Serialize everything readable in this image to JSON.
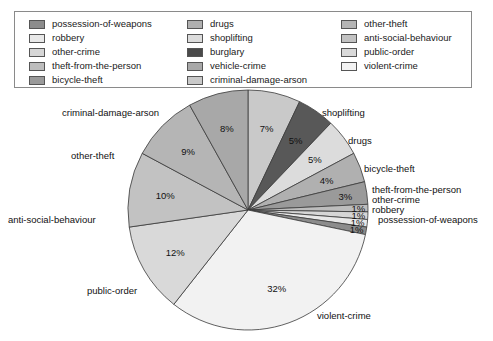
{
  "legend": {
    "columns": [
      [
        {
          "label": "possession-of-weapons",
          "color": "#8c8c8c"
        },
        {
          "label": "robbery",
          "color": "#e8e8e8"
        },
        {
          "label": "other-crime",
          "color": "#d6d6d6"
        },
        {
          "label": "theft-from-the-person",
          "color": "#bdbdbd"
        },
        {
          "label": "bicycle-theft",
          "color": "#9a9a9a"
        }
      ],
      [
        {
          "label": "drugs",
          "color": "#b0b0b0"
        },
        {
          "label": "shoplifting",
          "color": "#dcdcdc"
        },
        {
          "label": "burglary",
          "color": "#4a4a4a"
        },
        {
          "label": "vehicle-crime",
          "color": "#a8a8a8"
        },
        {
          "label": "criminal-damage-arson",
          "color": "#c9c9c9"
        }
      ],
      [
        {
          "label": "other-theft",
          "color": "#b5b5b5"
        },
        {
          "label": "anti-social-behaviour",
          "color": "#c2c2c2"
        },
        {
          "label": "public-order",
          "color": "#d9d9d9"
        },
        {
          "label": "violent-crime",
          "color": "#f2f2f2"
        }
      ]
    ]
  },
  "chart_data": {
    "type": "pie",
    "title": "",
    "unit": "%",
    "start_angle_deg": -90,
    "direction": "clockwise",
    "categories": [
      "criminal-damage-arson",
      "burglary",
      "shoplifting",
      "drugs",
      "bicycle-theft",
      "theft-from-the-person",
      "other-crime",
      "robbery",
      "possession-of-weapons",
      "violent-crime",
      "public-order",
      "anti-social-behaviour",
      "other-theft",
      "vehicle-crime"
    ],
    "values": [
      7,
      5,
      5,
      4,
      3,
      1,
      1,
      1,
      1,
      32,
      12,
      10,
      9,
      8
    ],
    "value_labels": [
      "7%",
      "5%",
      "5%",
      "4%",
      "3%",
      "1%",
      "1%",
      "1%",
      "1%",
      "32%",
      "12%",
      "10%",
      "9%",
      "8%"
    ],
    "colors": [
      "#c9c9c9",
      "#585858",
      "#dcdcdc",
      "#b0b0b0",
      "#9a9a9a",
      "#bdbdbd",
      "#d6d6d6",
      "#e8e8e8",
      "#8c8c8c",
      "#f2f2f2",
      "#d9d9d9",
      "#c2c2c2",
      "#b5b5b5",
      "#a8a8a8"
    ],
    "callouts": [
      {
        "label": "criminal-damage-arson",
        "x": 62,
        "y": 19
      },
      {
        "label": "other-theft",
        "x": 71,
        "y": 62
      },
      {
        "label": "anti-social-behaviour",
        "x": 8,
        "y": 126
      },
      {
        "label": "public-order",
        "x": 87,
        "y": 197
      },
      {
        "label": "violent-crime",
        "x": 317,
        "y": 222
      },
      {
        "label": "shoplifting",
        "x": 322,
        "y": 19
      },
      {
        "label": "drugs",
        "x": 348,
        "y": 47
      },
      {
        "label": "bicycle-theft",
        "x": 364,
        "y": 75
      },
      {
        "label": "theft-from-the-person",
        "x": 372,
        "y": 96
      },
      {
        "label": "other-crime",
        "x": 372,
        "y": 106
      },
      {
        "label": "robbery",
        "x": 372,
        "y": 116
      },
      {
        "label": "possession-of-weapons",
        "x": 378,
        "y": 126
      }
    ],
    "legend_position": "top",
    "grid": false
  }
}
